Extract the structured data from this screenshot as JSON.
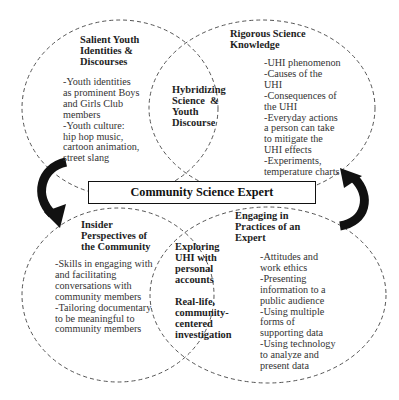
{
  "diagram": {
    "title": "Community Science Expert",
    "circles": [
      {
        "id": "top-left",
        "heading": [
          "Salient Youth",
          "Identities &",
          "Discourses"
        ],
        "body": [
          "-Youth identities",
          "as prominent Boys",
          "and Girls Club",
          "members",
          "-Youth culture:",
          "hip hop music,",
          "cartoon animation,",
          "street slang"
        ]
      },
      {
        "id": "top-right",
        "heading": [
          "Rigorous Science",
          "Knowledge"
        ],
        "body": [
          "-UHI phenomenon",
          "-Causes of the",
          "UHI",
          "-Consequences of",
          "the UHI",
          "-Everyday actions",
          "a person can take",
          "to mitigate the",
          "UHI effects",
          "-Experiments,",
          "temperature charts"
        ]
      },
      {
        "id": "bottom-left",
        "heading": [
          "Insider",
          "Perspectives of",
          "the Community"
        ],
        "body": [
          "-Skills in engaging with",
          "and facilitating",
          "conversations with",
          "community members",
          "-Tailoring documentary",
          "to be meaningful to",
          "community members"
        ]
      },
      {
        "id": "bottom-right",
        "heading": [
          "Engaging in",
          "Practices of an",
          "Expert"
        ],
        "body": [
          "-Attitudes and",
          "work ethics",
          "-Presenting",
          "information to a",
          "public audience",
          "-Using multiple",
          "forms of",
          "supporting data",
          "-Using technology",
          "to analyze and",
          "present data"
        ]
      }
    ],
    "overlaps": [
      {
        "id": "top-overlap",
        "lines": [
          "Hybridizing",
          "Science  &",
          "Youth",
          "Discourse"
        ]
      },
      {
        "id": "bottom-overlap",
        "lines": [
          "Exploring",
          "UHI with",
          "personal",
          "accounts",
          "",
          "Real-life,",
          "community-",
          "centered",
          "investigation"
        ]
      }
    ],
    "arrows": [
      {
        "side": "left",
        "direction": "top-to-bottom",
        "icon": "curved-arrow-down-icon"
      },
      {
        "side": "right",
        "direction": "bottom-to-top",
        "icon": "curved-arrow-up-icon"
      }
    ],
    "colors": {
      "dash_stroke": "#555555",
      "arrow_fill": "#111111",
      "box_border": "#111111",
      "background": "#ffffff"
    }
  }
}
